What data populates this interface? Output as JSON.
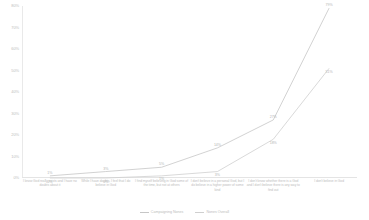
{
  "chart_data": {
    "type": "line",
    "title": "",
    "xlabel": "",
    "ylabel": "",
    "ylim": [
      0,
      80
    ],
    "grid": false,
    "legend_position": "bottom",
    "categories": [
      "I know God really exists and I have no doubts about it",
      "While I have doubts, I feel that I do believe in God",
      "I find myself believing in God some of the time, but not at others",
      "I don't believe in a personal God, but I do believe in a higher power of some kind",
      "I don't know whether there is a God and I don't believe there is any way to find out",
      "I don't believe in God"
    ],
    "ytick_labels": [
      "80%",
      "70%",
      "60%",
      "50%",
      "40%",
      "30%",
      "20%",
      "10%",
      "0%"
    ],
    "ytick_values": [
      80,
      70,
      60,
      50,
      40,
      30,
      20,
      10,
      0
    ],
    "series": [
      {
        "name": "Campaigning Nones",
        "color": "#c6c6c6",
        "values": [
          1,
          3,
          5,
          14,
          27,
          79
        ],
        "labels": [
          "1%",
          "3%",
          "5%",
          "14%",
          "27%",
          "79%"
        ]
      },
      {
        "name": "Nones Overall",
        "color": "#cfcfcf",
        "values": [
          0,
          0,
          1,
          3,
          18,
          51
        ],
        "labels": [
          "0%",
          "0%",
          "1%",
          "3%",
          "18%",
          "51%"
        ]
      }
    ]
  }
}
